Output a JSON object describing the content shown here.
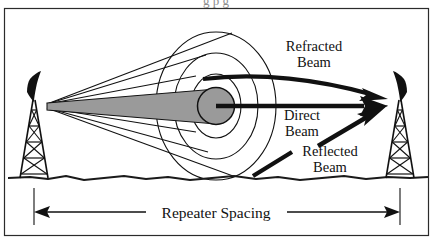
{
  "figure": {
    "border_color": "#2b2b2b",
    "background_color": "#ffffff",
    "ink_color": "#111111",
    "fresnel_fill": "#9a9a9a",
    "cone_fill": "#9a9a9a",
    "ground_color": "#1a1a1a",
    "clipped_caption_fragment": "g                                      p                        g"
  },
  "labels": {
    "refracted": {
      "line1": "Refracted",
      "line2": "Beam"
    },
    "direct": {
      "line1": "Direct",
      "line2": "Beam"
    },
    "reflected": {
      "line1": "Reflected",
      "line2": "Beam"
    },
    "dimension": "Repeater Spacing"
  },
  "towers": {
    "left": {
      "name": "left-repeater-tower"
    },
    "right": {
      "name": "right-repeater-tower"
    }
  }
}
